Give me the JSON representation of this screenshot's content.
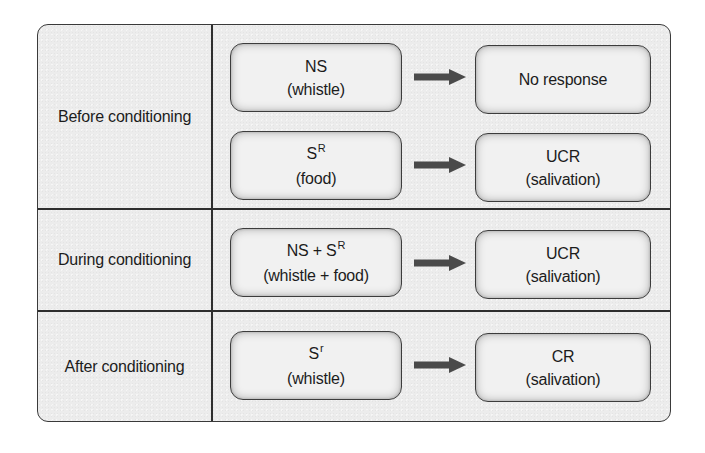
{
  "diagram": {
    "colors": {
      "panel_background": "#ececec",
      "border": "#3a3a3a",
      "arrow": "#4a4a4a",
      "text": "#1c1c1c"
    },
    "rows": [
      {
        "label": "Before conditioning",
        "pairs": [
          {
            "stimulus": {
              "line1": "NS",
              "line1_sup": "",
              "line2": "(whistle)"
            },
            "arrow": "arrow-right-icon",
            "response": {
              "line1": "No response",
              "line2": ""
            }
          },
          {
            "stimulus": {
              "line1": "S",
              "line1_sup": "R",
              "line2": "(food)"
            },
            "arrow": "arrow-right-icon",
            "response": {
              "line1": "UCR",
              "line2": "(salivation)"
            }
          }
        ]
      },
      {
        "label": "During conditioning",
        "pairs": [
          {
            "stimulus": {
              "line1": "NS + S",
              "line1_sup": "R",
              "line2": "(whistle + food)"
            },
            "arrow": "arrow-right-icon",
            "response": {
              "line1": "UCR",
              "line2": "(salivation)"
            }
          }
        ]
      },
      {
        "label": "After conditioning",
        "pairs": [
          {
            "stimulus": {
              "line1": "S",
              "line1_sup": "r",
              "line2": "(whistle)"
            },
            "arrow": "arrow-right-icon",
            "response": {
              "line1": "CR",
              "line2": "(salivation)"
            }
          }
        ]
      }
    ]
  }
}
